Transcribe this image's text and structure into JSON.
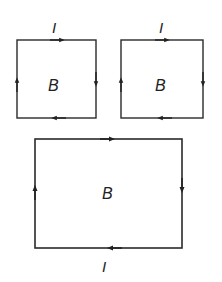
{
  "diagram": {
    "stroke_color": "#2a2a2a",
    "loops": [
      {
        "id": "loop-left",
        "field_label": "B",
        "current_label": "I",
        "current_label_position": "top",
        "direction": "clockwise"
      },
      {
        "id": "loop-right",
        "field_label": "B",
        "current_label": "I",
        "current_label_position": "top",
        "direction": "clockwise"
      },
      {
        "id": "loop-combined",
        "field_label": "B",
        "current_label": "I",
        "current_label_position": "bottom",
        "direction": "clockwise"
      }
    ]
  }
}
